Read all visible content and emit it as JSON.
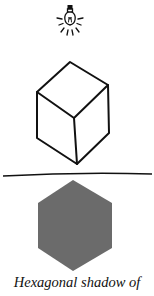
{
  "diagram": {
    "caption": "Hexagonal shadow of",
    "elements": [
      {
        "name": "light-bulb",
        "description": "light source above the cube"
      },
      {
        "name": "cube",
        "description": "isometric cube line drawing"
      },
      {
        "name": "ground-line",
        "description": "horizontal surface line"
      },
      {
        "name": "hexagonal-shadow",
        "description": "grey hexagon shadow cast by cube"
      }
    ],
    "colors": {
      "ink": "#111111",
      "shadow": "#6b6b6b",
      "background": "#ffffff"
    }
  }
}
